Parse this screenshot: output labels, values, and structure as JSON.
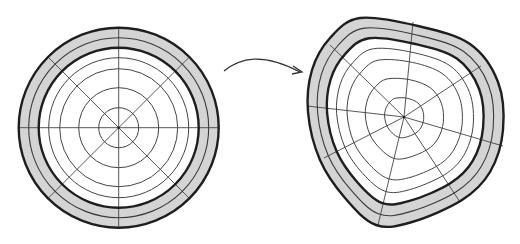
{
  "diagram": {
    "colors": {
      "background": "#ffffff",
      "band_fill": "#d4d4d4",
      "stroke": "#1e1e1e"
    },
    "left_figure": {
      "label": "undeformed circular cross-section",
      "center": [
        118.7,
        127.7
      ],
      "outer_radius": 100,
      "band_mid_radius": 90,
      "band_inner_radius": 80,
      "ring_radii": [
        20,
        40,
        59,
        70
      ],
      "spoke_angles_deg": [
        0,
        45,
        90,
        135,
        180,
        225,
        270,
        315
      ]
    },
    "arrow": {
      "label": "transformation arrow",
      "path": "M224,71 C240,58 262,52 300,72",
      "head_at": [
        302,
        72
      ]
    },
    "right_figure": {
      "label": "deformed cross-section",
      "center": [
        404,
        117
      ],
      "outer_points": [
        [
          360,
          18
        ],
        [
          418,
          26
        ],
        [
          470,
          44
        ],
        [
          498,
          82
        ],
        [
          503,
          130
        ],
        [
          490,
          172
        ],
        [
          462,
          200
        ],
        [
          412,
          222
        ],
        [
          376,
          225
        ],
        [
          345,
          198
        ],
        [
          320,
          160
        ],
        [
          308,
          112
        ],
        [
          312,
          70
        ],
        [
          330,
          38
        ]
      ],
      "scales": {
        "band_mid": 0.9,
        "band_inner": 0.8,
        "rings": [
          0.7,
          0.59,
          0.4,
          0.2
        ]
      },
      "spoke_ends": [
        [
          413,
          22
        ],
        [
          481,
          66
        ],
        [
          503,
          146
        ],
        [
          460,
          202
        ],
        [
          378,
          225
        ],
        [
          324,
          158
        ],
        [
          307,
          106
        ],
        [
          330,
          45
        ]
      ]
    }
  }
}
